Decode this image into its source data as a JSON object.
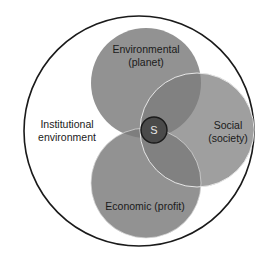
{
  "diagram": {
    "type": "venn",
    "outer": {
      "label_line1": "Institutional",
      "label_line2": "environment"
    },
    "circles": [
      {
        "id": "environmental",
        "label_line1": "Environmental",
        "label_line2": "(planet)"
      },
      {
        "id": "social",
        "label_line1": "Social",
        "label_line2": "(society)"
      },
      {
        "id": "economic",
        "label_line1": "Economic (profit)",
        "label_line2": ""
      }
    ],
    "center": {
      "label": "S"
    },
    "colors": {
      "background": "#ffffff",
      "outer_stroke": "#1a1a1a",
      "circle_fill": "#8c8c8c",
      "circle_edge": "#e8e8e8",
      "center_fill": "#4a4a4a",
      "center_stroke": "#1a1a1a",
      "text": "#1a1a1a"
    }
  }
}
